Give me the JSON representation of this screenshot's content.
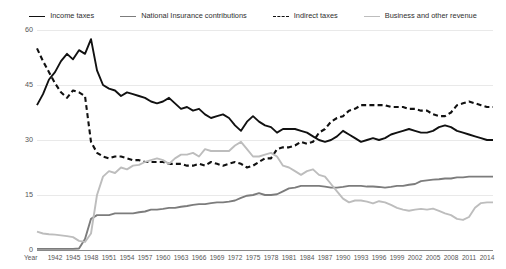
{
  "chart_data": {
    "type": "line",
    "title": "",
    "xlabel": "Year",
    "ylabel": "",
    "ylim": [
      0,
      60
    ],
    "xlim": [
      1939,
      2015
    ],
    "yticks": [
      0,
      15,
      30,
      45,
      60
    ],
    "xticks": [
      1942,
      1945,
      1948,
      1951,
      1954,
      1957,
      1960,
      1963,
      1966,
      1969,
      1972,
      1975,
      1978,
      1981,
      1984,
      1987,
      1990,
      1993,
      1996,
      1999,
      2002,
      2005,
      2008,
      2011,
      2014
    ],
    "grid": true,
    "legend_position": "top-center",
    "colors": {
      "income_taxes": "#111111",
      "national_insurance": "#7c7c7c",
      "indirect_taxes": "#111111",
      "business_other": "#bdbdbd"
    },
    "x": [
      1939,
      1940,
      1941,
      1942,
      1943,
      1944,
      1945,
      1946,
      1947,
      1948,
      1949,
      1950,
      1951,
      1952,
      1953,
      1954,
      1955,
      1956,
      1957,
      1958,
      1959,
      1960,
      1961,
      1962,
      1963,
      1964,
      1965,
      1966,
      1967,
      1968,
      1969,
      1970,
      1971,
      1972,
      1973,
      1974,
      1975,
      1976,
      1977,
      1978,
      1979,
      1980,
      1981,
      1982,
      1983,
      1984,
      1985,
      1986,
      1987,
      1988,
      1989,
      1990,
      1991,
      1992,
      1993,
      1994,
      1995,
      1996,
      1997,
      1998,
      1999,
      2000,
      2001,
      2002,
      2003,
      2004,
      2005,
      2006,
      2007,
      2008,
      2009,
      2010,
      2011,
      2012,
      2013,
      2014,
      2015
    ],
    "series": [
      {
        "name": "Income taxes",
        "style": "solid",
        "color": "#111111",
        "values": [
          39.5,
          42.5,
          46.5,
          48.5,
          51.5,
          53.5,
          52.0,
          54.5,
          53.5,
          57.5,
          49.0,
          45.0,
          44.0,
          43.5,
          42.0,
          43.0,
          42.5,
          42.0,
          41.5,
          40.5,
          40.0,
          40.5,
          41.5,
          40.0,
          38.5,
          39.0,
          38.0,
          38.5,
          37.0,
          36.0,
          36.5,
          37.0,
          36.0,
          34.0,
          32.5,
          35.0,
          36.5,
          35.0,
          34.0,
          33.5,
          32.0,
          33.0,
          33.0,
          33.0,
          32.5,
          32.0,
          31.0,
          30.0,
          29.5,
          30.0,
          31.0,
          32.5,
          31.5,
          30.5,
          29.5,
          30.0,
          30.5,
          30.0,
          30.5,
          31.5,
          32.0,
          32.5,
          33.0,
          32.5,
          32.0,
          32.0,
          32.5,
          33.5,
          34.0,
          33.5,
          32.5,
          32.0,
          31.5,
          31.0,
          30.5,
          30.0,
          30.0
        ]
      },
      {
        "name": "National Insurance contributions",
        "style": "solid",
        "color": "#7c7c7c",
        "values": [
          0.3,
          0.3,
          0.3,
          0.3,
          0.3,
          0.3,
          0.3,
          0.4,
          3.0,
          8.5,
          9.5,
          9.5,
          9.5,
          10.0,
          10.0,
          10.0,
          10.0,
          10.3,
          10.5,
          11.0,
          11.0,
          11.2,
          11.5,
          11.5,
          11.8,
          12.0,
          12.3,
          12.5,
          12.5,
          12.8,
          13.0,
          13.0,
          13.2,
          13.5,
          14.2,
          14.8,
          15.0,
          15.5,
          15.0,
          15.0,
          15.2,
          16.0,
          16.8,
          17.0,
          17.5,
          17.5,
          17.5,
          17.5,
          17.3,
          17.0,
          17.0,
          17.2,
          17.5,
          17.5,
          17.5,
          17.3,
          17.3,
          17.2,
          17.0,
          17.2,
          17.5,
          17.5,
          17.8,
          18.0,
          18.8,
          19.0,
          19.2,
          19.3,
          19.5,
          19.5,
          19.8,
          19.8,
          20.0,
          20.0,
          20.0,
          20.0,
          20.0
        ]
      },
      {
        "name": "Indirect taxes",
        "style": "dashed",
        "color": "#111111",
        "values": [
          55.0,
          51.5,
          48.5,
          45.5,
          43.0,
          41.5,
          43.5,
          43.0,
          42.0,
          29.5,
          26.5,
          25.5,
          25.0,
          25.5,
          25.5,
          25.0,
          24.5,
          24.5,
          24.0,
          24.0,
          24.0,
          24.0,
          23.5,
          23.5,
          23.5,
          23.0,
          23.0,
          23.5,
          23.0,
          24.0,
          23.5,
          23.0,
          23.5,
          24.0,
          23.5,
          22.5,
          23.0,
          24.0,
          25.0,
          25.0,
          27.5,
          28.0,
          28.0,
          28.5,
          29.5,
          29.0,
          29.5,
          32.0,
          33.0,
          35.0,
          36.0,
          36.5,
          38.0,
          38.5,
          39.5,
          39.5,
          39.5,
          39.5,
          39.5,
          39.0,
          39.0,
          39.0,
          38.5,
          38.5,
          38.0,
          38.0,
          37.0,
          36.5,
          36.5,
          37.5,
          39.5,
          40.0,
          40.5,
          40.0,
          39.5,
          39.0,
          39.0
        ]
      },
      {
        "name": "Business and other revenue",
        "style": "solid",
        "color": "#bdbdbd",
        "values": [
          5.0,
          4.5,
          4.3,
          4.2,
          4.0,
          3.8,
          3.5,
          2.5,
          2.2,
          4.5,
          15.0,
          20.0,
          21.5,
          21.0,
          22.5,
          22.0,
          23.0,
          23.2,
          24.0,
          24.5,
          25.0,
          24.5,
          23.5,
          25.0,
          26.0,
          26.0,
          26.5,
          25.5,
          27.5,
          27.0,
          27.0,
          27.0,
          27.0,
          28.5,
          29.5,
          27.5,
          25.5,
          25.5,
          26.0,
          26.5,
          25.5,
          23.0,
          22.5,
          21.5,
          20.5,
          21.5,
          22.0,
          20.5,
          20.0,
          18.0,
          16.0,
          14.0,
          13.0,
          13.5,
          13.5,
          13.2,
          12.7,
          13.3,
          13.0,
          12.3,
          11.5,
          11.0,
          10.7,
          11.0,
          11.2,
          11.0,
          11.3,
          10.7,
          10.0,
          9.5,
          8.5,
          8.2,
          9.0,
          11.5,
          12.8,
          13.0,
          13.0
        ]
      }
    ]
  }
}
